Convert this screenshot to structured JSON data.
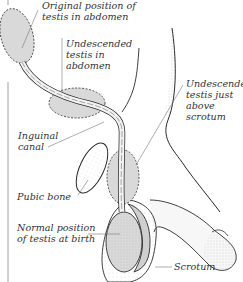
{
  "diagram": {
    "labels": {
      "original_position": "Original position of\ntestis in abdomen",
      "undescended_abdomen": "Undescended\ntestis in\nabdomen",
      "inguinal_canal": "Inguinal\ncanal",
      "undescended_above_scrotum": "Undescended\ntestis just\nabove\nscrotum",
      "pubic_bone": "Pubic bone",
      "normal_position": "Normal position\nof testis at birth",
      "scrotum": "Scrotum"
    },
    "colors": {
      "outline": "#2a2a2a",
      "testis_fill": "#d9d9d9",
      "leader_line": "#777777",
      "text": "#333333",
      "stipple": "#9a9a9a"
    }
  }
}
